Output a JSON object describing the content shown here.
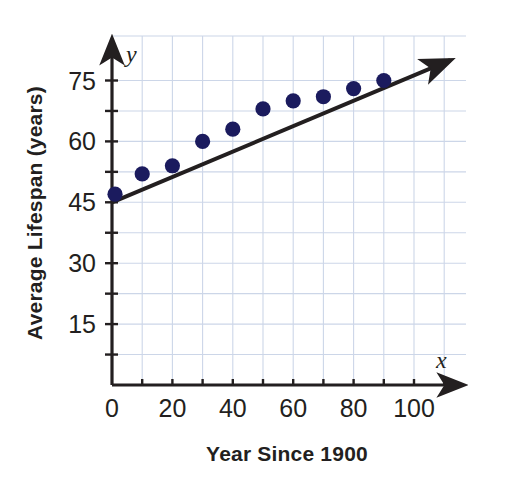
{
  "chart_data": {
    "type": "scatter",
    "title": "",
    "subtitle": "",
    "xlabel": "Year Since 1900",
    "ylabel": "Average Lifespan (years)",
    "x_var_label": "x",
    "y_var_label": "y",
    "xlim": [
      0,
      113
    ],
    "ylim": [
      0,
      82
    ],
    "x_major_ticks": [
      0,
      20,
      40,
      60,
      80,
      100
    ],
    "x_minor_ticks": [
      10,
      30,
      50,
      70,
      90,
      110
    ],
    "x_tick_labels": [
      "0",
      "20",
      "40",
      "60",
      "80",
      "100"
    ],
    "y_major_ticks": [
      15,
      30,
      45,
      60,
      75
    ],
    "y_minor_ticks": [
      7.5,
      22.5,
      37.5,
      52.5,
      67.5
    ],
    "y_tick_labels": [
      "15",
      "30",
      "45",
      "60",
      "75"
    ],
    "grid": true,
    "grid_color": "#ccd6e8",
    "axis_color": "#231f20",
    "point_color": "#1b1b5e",
    "trendline_color": "#231f20",
    "legend": "none",
    "points": [
      {
        "x": 1,
        "y": 47
      },
      {
        "x": 10,
        "y": 52
      },
      {
        "x": 20,
        "y": 54
      },
      {
        "x": 30,
        "y": 60
      },
      {
        "x": 40,
        "y": 63
      },
      {
        "x": 50,
        "y": 68
      },
      {
        "x": 60,
        "y": 70
      },
      {
        "x": 70,
        "y": 71
      },
      {
        "x": 80,
        "y": 73
      },
      {
        "x": 90,
        "y": 75
      }
    ],
    "trendline": {
      "label": "line of fit",
      "x_start": 0,
      "y_start": 45,
      "x_end": 112,
      "y_end": 80,
      "slope": 0.3125,
      "intercept": 45
    }
  }
}
